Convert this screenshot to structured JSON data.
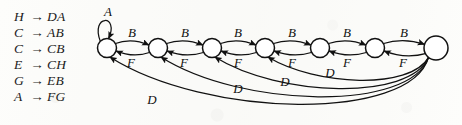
{
  "figure": {
    "background_color": "#fdfdfb",
    "ink_color": "#111111",
    "width": 462,
    "height": 125
  },
  "grammar": {
    "arrow_glyph": "→",
    "rules": [
      {
        "lhs": "H",
        "rhs": "DA"
      },
      {
        "lhs": "C",
        "rhs": "AB"
      },
      {
        "lhs": "C",
        "rhs": "CB"
      },
      {
        "lhs": "E",
        "rhs": "CH"
      },
      {
        "lhs": "G",
        "rhs": "EB"
      },
      {
        "lhs": "A",
        "rhs": "FG"
      }
    ]
  },
  "graph": {
    "node_count": 7,
    "nodes": [
      {
        "id": "n1",
        "cx": 107,
        "cy": 48,
        "r": 9.5
      },
      {
        "id": "n2",
        "cx": 158,
        "cy": 48,
        "r": 9.5
      },
      {
        "id": "n3",
        "cx": 212,
        "cy": 48,
        "r": 9.5
      },
      {
        "id": "n4",
        "cx": 265,
        "cy": 48,
        "r": 9.5
      },
      {
        "id": "n5",
        "cx": 320,
        "cy": 48,
        "r": 9.5
      },
      {
        "id": "n6",
        "cx": 375,
        "cy": 48,
        "r": 9.5
      },
      {
        "id": "n7",
        "cx": 436,
        "cy": 48,
        "r": 12
      }
    ],
    "self_loop": {
      "node": "n1",
      "label": "A",
      "label_x": 108,
      "label_y": 12
    },
    "forward_labels": [
      {
        "label": "B",
        "x": 132,
        "y": 33
      },
      {
        "label": "B",
        "x": 185,
        "y": 33
      },
      {
        "label": "B",
        "x": 238,
        "y": 33
      },
      {
        "label": "B",
        "x": 292,
        "y": 33
      },
      {
        "label": "B",
        "x": 347,
        "y": 33
      },
      {
        "label": "B",
        "x": 404,
        "y": 33
      }
    ],
    "backward_labels": [
      {
        "label": "F",
        "x": 131,
        "y": 63
      },
      {
        "label": "F",
        "x": 184,
        "y": 63
      },
      {
        "label": "F",
        "x": 238,
        "y": 63
      },
      {
        "label": "F",
        "x": 292,
        "y": 63
      },
      {
        "label": "F",
        "x": 347,
        "y": 63
      },
      {
        "label": "F",
        "x": 403,
        "y": 63
      }
    ],
    "long_arc_labels": [
      {
        "label": "D",
        "x": 152,
        "y": 100
      },
      {
        "label": "D",
        "x": 238,
        "y": 89
      },
      {
        "label": "D",
        "x": 285,
        "y": 82
      },
      {
        "label": "D",
        "x": 330,
        "y": 73
      }
    ]
  }
}
